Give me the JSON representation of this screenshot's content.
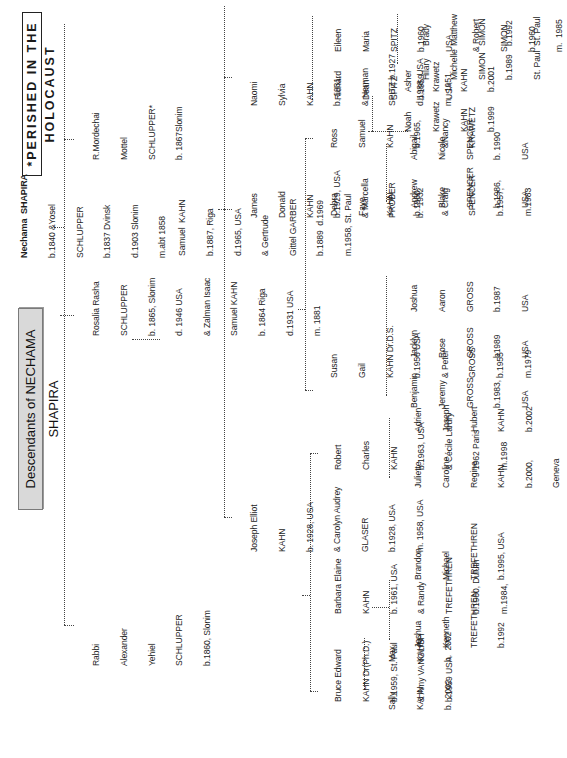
{
  "document": {
    "title": "Descendants of NECHAMA SHAPIRA",
    "legend": "*PERISHED IN THE HOLOCAUST"
  },
  "people": {
    "nechama": [
      "Nechama  SHAPIRA",
      "b.1840 &Yosel",
      "SCHLUPPER",
      "b.1837 Dvinsk",
      "d.1903 Slonim",
      "m.abt 1858"
    ],
    "alexander": [
      "Rabbi",
      "Alexander",
      "Yehiel",
      "SCHLUPPER",
      "b.1860, Slonim"
    ],
    "rosalia": [
      "Rosalia Rasha",
      "SCHLUPPER",
      "b. 1865, Slonim",
      "d. 1946 USA",
      "& Zalman Isaac",
      "Samuel KAHN",
      "b. 1864 Riga",
      "d.1931 USA",
      "m. 1881"
    ],
    "mordechai": [
      "R.Mordechai",
      "Mottel",
      "SCHLUPPER*",
      "b. 1867Slonim"
    ],
    "samuel": [
      "Samuel  KAHN",
      "b.1887, Riga",
      "d.1965, USA",
      "& Gertrude",
      "Gittel GARBER",
      "b.1889  d.1969",
      "m.1958, St. Paul"
    ],
    "joseph": [
      "Joseph Elliot",
      "KAHN",
      "b. 1928, USA",
      "& Carolyn Audrey",
      "GLASER",
      "b.1928, USA",
      "m. 1958, USA"
    ],
    "james": [
      "James",
      "Donald",
      "KAHN",
      "b.1929, USA",
      "& Marcella",
      "PROBER",
      "b.  1932"
    ],
    "naomi": [
      "Naomi",
      "Sylvia",
      "KAHN",
      "b. 1931,",
      "& Herman",
      "SPITZ b.1927",
      "d.1988, USA",
      "m.  1951"
    ],
    "bruce": [
      "Bruce Edward",
      "KAHN Dr(Ph.D.)",
      "b.1959, St. Paul",
      "& Amy VANGLISH",
      "b.1959 USA"
    ],
    "barbara": [
      "Barbara Elaine",
      "KAHN",
      "b. 1961, USA",
      "& Randy",
      "TREFETHREN",
      "b.1960, Duluth",
      "m.1984,"
    ],
    "robert": [
      "Robert",
      "Charles",
      "KAHN",
      "b.1963, USA",
      "& Cécile Lardry",
      "1962 Paris",
      "m.1998"
    ],
    "susan": [
      "Susan",
      "Gail",
      "KAHN Dr.D.S.",
      "b.1956 USA",
      "& Peter",
      "GROSS",
      "b.1955",
      "m.1979"
    ],
    "debra": [
      "Debra",
      "Faye",
      "KAHN",
      "b.1960,",
      "& Craig",
      "SPENCER",
      "b.1957,",
      "m.1983"
    ],
    "ross": [
      "Ross",
      "Samuel",
      "KAHN",
      "b.1965,",
      "&Nancy",
      "KRAWETZ"
    ],
    "richard": [
      "Richard",
      "Dean",
      "SPITZ",
      "b.1959",
      "USA"
    ],
    "eileen": [
      "Eileen",
      "Maria",
      "SPITZ",
      "b.1960",
      "USA",
      "& Robert",
      "SIMON",
      "b.1960",
      "m.  1985"
    ],
    "sally": [
      "Sally",
      "KAHN",
      "b.  2002"
    ],
    "max": [
      "Max",
      "KAHN",
      "b.  2002"
    ],
    "joshua_t": [
      "Joshua",
      "Kenneth",
      "TREFETHREN",
      "b.1992"
    ],
    "brandon": [
      "Brandon",
      "Michael",
      "TREFETHREN",
      "b.1995, USA"
    ],
    "juliette": [
      "Juliette",
      "Caroline",
      "Regine",
      "KAHN",
      "b.2000,",
      "Geneva"
    ],
    "adrien": [
      "Adrien",
      "Joseph",
      "Hubert",
      "KAHN",
      "b.2002"
    ],
    "benjamin": [
      "Benjamin",
      "Jeremy",
      "GROSS",
      "b.1983,",
      "USA"
    ],
    "jacklyn": [
      "Jacklyn",
      "Rose",
      "GROSS",
      "b1989",
      "USA"
    ],
    "joshua_g": [
      "Joshua",
      "Aaron",
      "GROSS",
      "b.1987",
      "USA"
    ],
    "andrew": [
      "Andrew",
      "Blake",
      "SPENCER",
      "b.1986,",
      "USA"
    ],
    "abigail": [
      "Abigail",
      "Nicole",
      "SPENCER",
      "b. 1990",
      "USA"
    ],
    "noah": [
      "Noah",
      "Krawetz",
      "KAHN",
      "b.1999"
    ],
    "asher": [
      "Asher",
      "Krawetz",
      "KAHN",
      "b.2001"
    ],
    "hilary": [
      "Hilary",
      "Michelle",
      "SIMON",
      "b.1989",
      "St. Paul"
    ],
    "brady": [
      "Brady",
      "Matthew",
      "SIMON",
      "b.1992",
      "St. Paul"
    ]
  }
}
